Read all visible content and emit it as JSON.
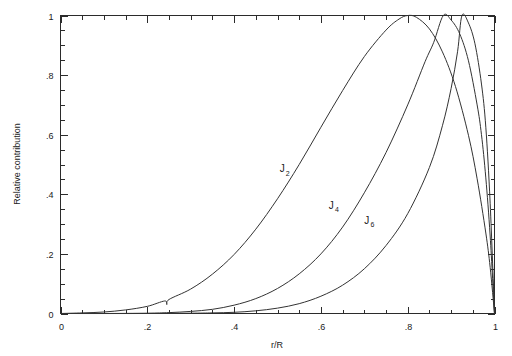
{
  "chart_data": {
    "type": "line",
    "title": "",
    "xlabel": "r/R",
    "ylabel": "Relative contribution",
    "xlim": [
      0,
      1
    ],
    "ylim": [
      0,
      1
    ],
    "grid": false,
    "legend_position": "inline-annotations",
    "x_ticks_major": [
      "0",
      ".2",
      ".4",
      ".6",
      ".8",
      "1"
    ],
    "x_ticks_major_values": [
      0,
      0.2,
      0.4,
      0.6,
      0.8,
      1
    ],
    "y_ticks_major": [
      "0",
      ".2",
      ".4",
      ".6",
      ".8",
      "1"
    ],
    "y_ticks_major_values": [
      0,
      0.2,
      0.4,
      0.6,
      0.8,
      1
    ],
    "minor_tick_step": 0.05,
    "series": [
      {
        "name": "J_2",
        "label_text": "J",
        "label_sub": "2",
        "label_x": 0.505,
        "label_y": 0.475,
        "peak_x": 0.8,
        "peak_y": 1,
        "points": [
          [
            0.0,
            0.0
          ],
          [
            0.05,
            0.002
          ],
          [
            0.1,
            0.005
          ],
          [
            0.15,
            0.012
          ],
          [
            0.2,
            0.024
          ],
          [
            0.24,
            0.042
          ],
          [
            0.245,
            0.03
          ],
          [
            0.25,
            0.047
          ],
          [
            0.3,
            0.082
          ],
          [
            0.35,
            0.132
          ],
          [
            0.4,
            0.198
          ],
          [
            0.45,
            0.283
          ],
          [
            0.5,
            0.385
          ],
          [
            0.55,
            0.5
          ],
          [
            0.6,
            0.625
          ],
          [
            0.65,
            0.748
          ],
          [
            0.7,
            0.862
          ],
          [
            0.75,
            0.951
          ],
          [
            0.78,
            0.988
          ],
          [
            0.8,
            1.0
          ],
          [
            0.82,
            0.994
          ],
          [
            0.85,
            0.955
          ],
          [
            0.88,
            0.878
          ],
          [
            0.91,
            0.762
          ],
          [
            0.94,
            0.598
          ],
          [
            0.96,
            0.452
          ],
          [
            0.98,
            0.27
          ],
          [
            0.99,
            0.155
          ],
          [
            1.0,
            0.0
          ]
        ]
      },
      {
        "name": "J_4",
        "label_text": "J",
        "label_sub": "4",
        "label_x": 0.618,
        "label_y": 0.352,
        "peak_x": 0.882,
        "peak_y": 1,
        "points": [
          [
            0.0,
            0.0
          ],
          [
            0.1,
            0.0
          ],
          [
            0.2,
            0.001
          ],
          [
            0.25,
            0.003
          ],
          [
            0.3,
            0.007
          ],
          [
            0.35,
            0.014
          ],
          [
            0.4,
            0.028
          ],
          [
            0.45,
            0.05
          ],
          [
            0.5,
            0.084
          ],
          [
            0.55,
            0.133
          ],
          [
            0.6,
            0.2
          ],
          [
            0.65,
            0.29
          ],
          [
            0.7,
            0.405
          ],
          [
            0.75,
            0.54
          ],
          [
            0.8,
            0.7
          ],
          [
            0.84,
            0.845
          ],
          [
            0.86,
            0.91
          ],
          [
            0.882,
            1.0
          ],
          [
            0.9,
            0.985
          ],
          [
            0.92,
            0.938
          ],
          [
            0.94,
            0.848
          ],
          [
            0.96,
            0.7
          ],
          [
            0.97,
            0.6
          ],
          [
            0.98,
            0.455
          ],
          [
            0.99,
            0.26
          ],
          [
            1.0,
            0.0
          ]
        ]
      },
      {
        "name": "J_6",
        "label_text": "J",
        "label_sub": "6",
        "label_x": 0.7,
        "label_y": 0.302,
        "peak_x": 0.925,
        "peak_y": 1,
        "points": [
          [
            0.0,
            0.0
          ],
          [
            0.2,
            0.0
          ],
          [
            0.3,
            0.001
          ],
          [
            0.35,
            0.002
          ],
          [
            0.4,
            0.004
          ],
          [
            0.45,
            0.009
          ],
          [
            0.5,
            0.018
          ],
          [
            0.55,
            0.033
          ],
          [
            0.6,
            0.058
          ],
          [
            0.65,
            0.095
          ],
          [
            0.7,
            0.15
          ],
          [
            0.75,
            0.228
          ],
          [
            0.8,
            0.335
          ],
          [
            0.85,
            0.49
          ],
          [
            0.88,
            0.63
          ],
          [
            0.9,
            0.755
          ],
          [
            0.915,
            0.88
          ],
          [
            0.925,
            1.0
          ],
          [
            0.94,
            0.975
          ],
          [
            0.955,
            0.905
          ],
          [
            0.97,
            0.77
          ],
          [
            0.98,
            0.625
          ],
          [
            0.99,
            0.37
          ],
          [
            1.0,
            0.0
          ]
        ]
      }
    ]
  },
  "axes": {
    "x_label": "r/R",
    "y_label": "Relative contribution"
  }
}
